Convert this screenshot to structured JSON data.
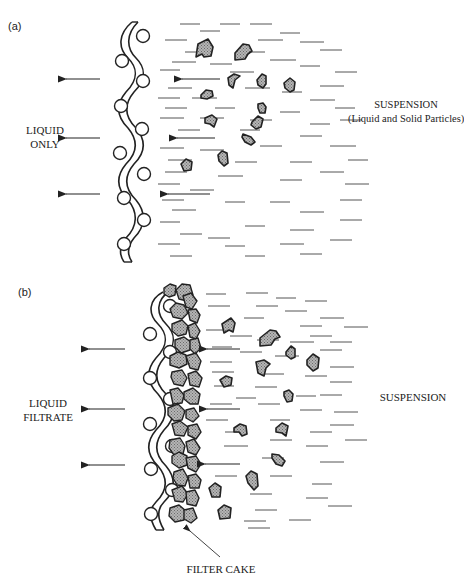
{
  "figure": {
    "panel_a": {
      "tag": "(a)",
      "left_label_line1": "LIQUID",
      "left_label_line2": "ONLY",
      "right_label_line1": "SUSPENSION",
      "right_label_line2": "(Liquid and Solid Particles)"
    },
    "panel_b": {
      "tag": "(b)",
      "left_label_line1": "LIQUID",
      "left_label_line2": "FILTRATE",
      "right_label": "SUSPENSION",
      "bottom_label": "FILTER CAKE"
    },
    "colors": {
      "line": "#222222",
      "particle_fill": "#9a9a9a",
      "dash": "#555555"
    }
  }
}
